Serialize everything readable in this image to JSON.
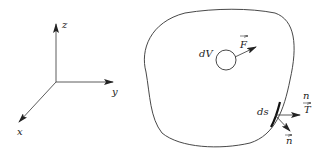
{
  "diagram": {
    "axes": {
      "x_label": "x",
      "y_label": "y",
      "z_label": "z"
    },
    "body": {
      "volume_element_label": "dV",
      "body_force_label": "F",
      "surface_element_label": "ds",
      "traction_label_top": "n",
      "traction_label": "T",
      "normal_label": "n"
    },
    "colors": {
      "stroke": "#333333",
      "background": "#ffffff"
    }
  }
}
